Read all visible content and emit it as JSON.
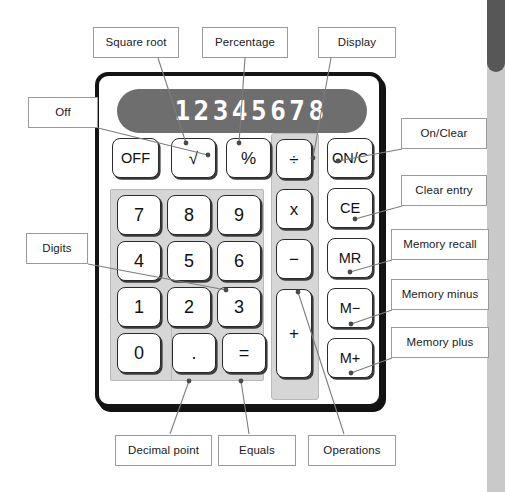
{
  "figure": {
    "display_value": "12345678"
  },
  "calculator": {
    "display": {
      "value": "12345678"
    },
    "function_keys": [
      {
        "id": "off",
        "label": "OFF"
      },
      {
        "id": "sqrt",
        "label": "√"
      },
      {
        "id": "percent",
        "label": "%"
      }
    ],
    "digit_keys": [
      {
        "id": "seven",
        "label": "7"
      },
      {
        "id": "eight",
        "label": "8"
      },
      {
        "id": "nine",
        "label": "9"
      },
      {
        "id": "four",
        "label": "4"
      },
      {
        "id": "five",
        "label": "5"
      },
      {
        "id": "six",
        "label": "6"
      },
      {
        "id": "one",
        "label": "1"
      },
      {
        "id": "two",
        "label": "2"
      },
      {
        "id": "three",
        "label": "3"
      },
      {
        "id": "zero",
        "label": "0"
      }
    ],
    "bottom_keys": [
      {
        "id": "decimal",
        "label": "."
      },
      {
        "id": "equals",
        "label": "="
      }
    ],
    "operation_keys": [
      {
        "id": "divide",
        "label": "÷"
      },
      {
        "id": "multiply",
        "label": "x"
      },
      {
        "id": "minus",
        "label": "−"
      },
      {
        "id": "plus",
        "label": "+"
      }
    ],
    "right_keys": [
      {
        "id": "on-clear",
        "label": "ON/C"
      },
      {
        "id": "clear-entry",
        "label": "CE"
      },
      {
        "id": "memory-recall",
        "label": "MR"
      },
      {
        "id": "memory-minus",
        "label": "M−"
      },
      {
        "id": "memory-plus",
        "label": "M+"
      }
    ]
  },
  "callouts": {
    "square_root": "Square root",
    "percentage": "Percentage",
    "display": "Display",
    "off": "Off",
    "digits": "Digits",
    "on_clear": "On/Clear",
    "clear_entry": "Clear entry",
    "memory_recall": "Memory recall",
    "memory_minus": "Memory minus",
    "memory_plus": "Memory plus",
    "decimal_point": "Decimal point",
    "equals": "Equals",
    "operations": "Operations"
  },
  "colors": {
    "body_border": "#141414",
    "display_bg": "#6e6e6e",
    "display_text": "#ffffff",
    "panel_gray": "#d6d6d6",
    "key_face": "#ffffff",
    "callout_border": "#9a9a9a",
    "leader_line": "#7d7d7d",
    "page_edge_light": "#c9c9c9",
    "page_edge_dark": "#575757"
  }
}
